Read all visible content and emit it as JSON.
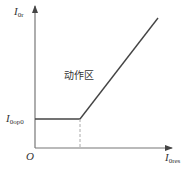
{
  "diagram": {
    "y_axis": {
      "label_main": "I",
      "label_sub": "0r"
    },
    "x_axis": {
      "label_main": "I",
      "label_sub": "0res"
    },
    "origin_label": "O",
    "threshold": {
      "label_main": "I",
      "label_sub": "0op0"
    },
    "region_label": "动作区",
    "colors": {
      "axis": "#555555",
      "curve": "#444444",
      "dashed": "#aaaaaa",
      "text": "#333333"
    }
  }
}
